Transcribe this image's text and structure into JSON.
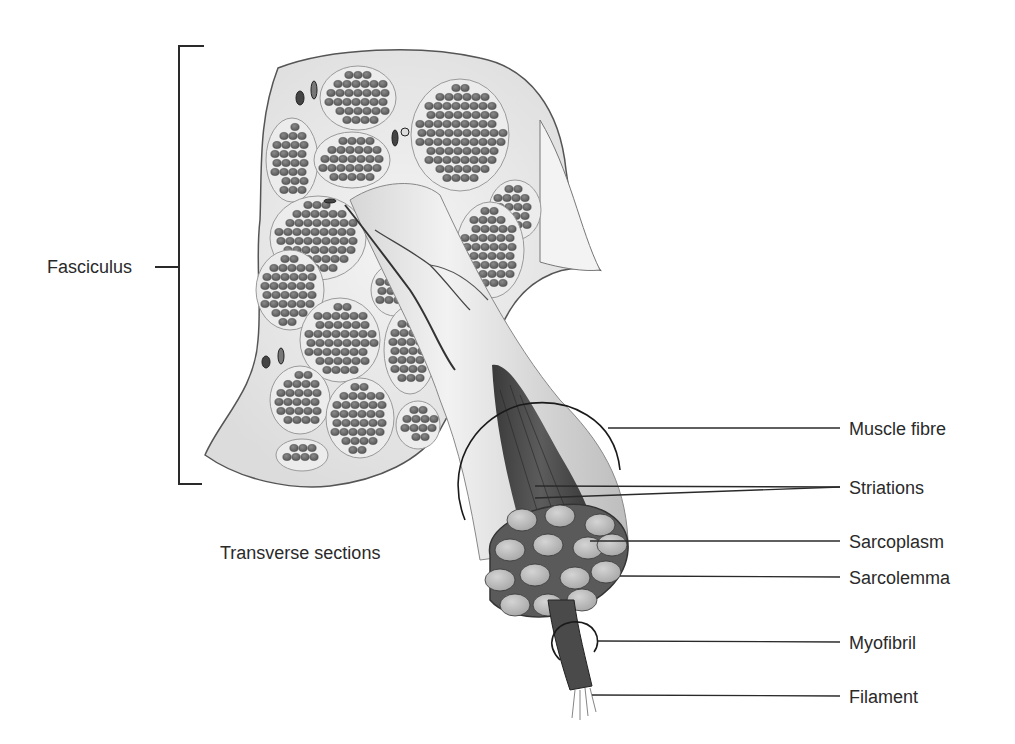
{
  "diagram": {
    "labels": {
      "fasciculus": "Fasciculus",
      "transverse_sections": "Transverse sections",
      "muscle_fibre": "Muscle fibre",
      "striations": "Striations",
      "sarcoplasm": "Sarcoplasm",
      "sarcolemma": "Sarcolemma",
      "myofibril": "Myofibril",
      "filament": "Filament"
    },
    "colors": {
      "background": "#ffffff",
      "line": "#2a2a2a",
      "fascicle_fill": "#e8e8e8",
      "fibre_cell": "#6e6e6e",
      "myofibril_fill": "#b8b8b8",
      "filament_bundle": "#4a4a4a"
    }
  }
}
